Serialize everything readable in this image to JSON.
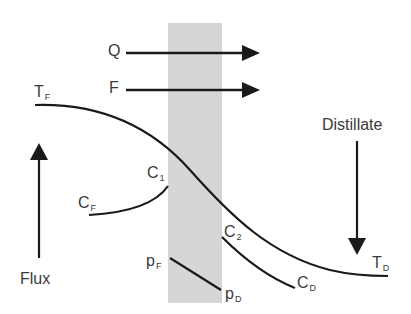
{
  "diagram": {
    "title_implied": "Membrane distillation transport profile",
    "membrane": {
      "color": "#d6d6d6"
    },
    "arrows": {
      "heat_flow": {
        "label": "Q"
      },
      "mass_flow": {
        "label": "F"
      },
      "flux": {
        "label": "Flux"
      },
      "distillate": {
        "label": "Distillate"
      }
    },
    "labels": {
      "T_feed": {
        "main": "T",
        "sub": "F"
      },
      "T_distillate": {
        "main": "T",
        "sub": "D"
      },
      "C_feed": {
        "main": "C",
        "sub": "F"
      },
      "C_1": {
        "main": "C",
        "sub": "1"
      },
      "C_2": {
        "main": "C",
        "sub": "2"
      },
      "C_distillate": {
        "main": "C",
        "sub": "D"
      },
      "p_feed": {
        "main": "p",
        "sub": "F"
      },
      "p_distillate": {
        "main": "p",
        "sub": "D"
      }
    },
    "line_color": "#1a1a1a",
    "text_color": "#3a3a3a"
  }
}
